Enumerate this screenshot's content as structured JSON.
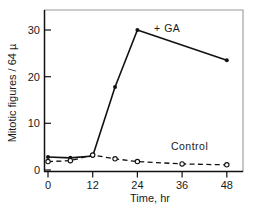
{
  "chart_data": {
    "type": "line",
    "title": "",
    "xlabel": "Time, hr",
    "ylabel": "Mitotic figures / 64 µ",
    "xlim": [
      0,
      50
    ],
    "ylim": [
      0,
      34
    ],
    "xticks": [
      0,
      12,
      24,
      36,
      48
    ],
    "xticklabels": [
      "0",
      "12",
      "24",
      "36",
      "48"
    ],
    "yticks": [
      0,
      10,
      20,
      30
    ],
    "yticklabels": [
      "0",
      "10",
      "20",
      "30"
    ],
    "grid": false,
    "legend_position": "inline-annotations",
    "series": [
      {
        "name": "+GA",
        "label": "+ GA",
        "linestyle": "solid",
        "marker": "filled-circle",
        "color": "#111111",
        "x": [
          0,
          6,
          12,
          18,
          24,
          48
        ],
        "y": [
          2.8,
          2.6,
          3.0,
          17.8,
          30.0,
          23.5
        ],
        "label_x": 32,
        "label_y": 29.5
      },
      {
        "name": "Control",
        "label": "Control",
        "linestyle": "dashed",
        "marker": "open-circle",
        "color": "#111111",
        "x": [
          0,
          6,
          12,
          18,
          24,
          36,
          48
        ],
        "y": [
          1.8,
          2.0,
          3.2,
          2.4,
          1.8,
          1.3,
          1.1
        ],
        "label_x": 38,
        "label_y": 4.2
      }
    ]
  },
  "axes": {
    "x_axis_title": "Time, hr",
    "y_axis_title": "Mitotic figures / 64 µ"
  },
  "colors": {
    "ink": "#111111",
    "frame": "#9a9a9a",
    "background": "#ffffff"
  }
}
